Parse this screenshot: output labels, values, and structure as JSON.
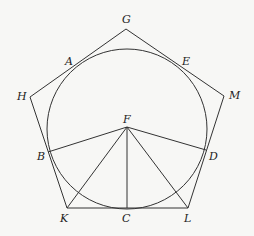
{
  "diagram": {
    "type": "geometry",
    "circle": {
      "cx": 127,
      "cy": 129,
      "r": 80
    },
    "points": {
      "G": {
        "x": 126,
        "y": 29,
        "label": "G",
        "lx": 122,
        "ly": 23
      },
      "M": {
        "x": 224,
        "y": 96,
        "label": "M",
        "lx": 229,
        "ly": 99
      },
      "L": {
        "x": 188,
        "y": 208,
        "label": "L",
        "lx": 184,
        "ly": 222
      },
      "K": {
        "x": 67,
        "y": 208,
        "label": "K",
        "lx": 60,
        "ly": 222
      },
      "H": {
        "x": 30,
        "y": 97,
        "label": "H",
        "lx": 17,
        "ly": 100
      },
      "A": {
        "x": 72,
        "y": 70,
        "label": "A",
        "lx": 65,
        "ly": 65
      },
      "E": {
        "x": 180,
        "y": 68,
        "label": "E",
        "lx": 182,
        "ly": 65
      },
      "D": {
        "x": 206,
        "y": 150,
        "label": "D",
        "lx": 209,
        "ly": 160
      },
      "B": {
        "x": 48,
        "y": 152,
        "label": "B",
        "lx": 37,
        "ly": 160
      },
      "C": {
        "x": 127,
        "y": 208,
        "label": "C",
        "lx": 122,
        "ly": 222
      },
      "F": {
        "x": 127,
        "y": 127,
        "label": "F",
        "lx": 123,
        "ly": 123
      }
    },
    "polygon": [
      "G",
      "M",
      "L",
      "K",
      "H"
    ],
    "segments": [
      [
        "F",
        "B"
      ],
      [
        "F",
        "D"
      ],
      [
        "F",
        "K"
      ],
      [
        "F",
        "C"
      ],
      [
        "F",
        "L"
      ]
    ]
  }
}
